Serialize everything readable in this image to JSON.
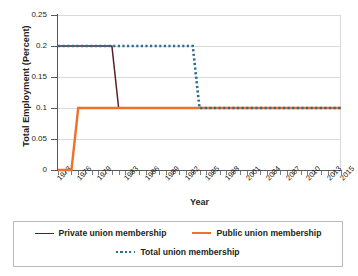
{
  "chart_data": {
    "type": "line",
    "title": "",
    "xlabel": "Year",
    "ylabel": "Total Employment (Percent)",
    "ylim": [
      0,
      0.25
    ],
    "xlim": [
      1973,
      2015
    ],
    "grid": true,
    "legend_position": "bottom",
    "ytick_labels": [
      "0.25",
      "0.2",
      "0.15",
      "0.1",
      "0.05",
      "0"
    ],
    "ytick_values": [
      0.25,
      0.2,
      0.15,
      0.1,
      0.05,
      0
    ],
    "xtick_labels": [
      "1973",
      "1976",
      "1979",
      "1983",
      "1986",
      "1989",
      "1992",
      "1995",
      "1998",
      "2001",
      "2004",
      "2007",
      "2010",
      "2013",
      "2015"
    ],
    "xtick_values": [
      1973,
      1976,
      1979,
      1983,
      1986,
      1989,
      1992,
      1995,
      1998,
      2001,
      2004,
      2007,
      2010,
      2013,
      2015
    ],
    "series": [
      {
        "name": "Private union membership",
        "color": "#5b1f28",
        "style": "solid",
        "x": [
          1973,
          1974,
          1975,
          1976,
          1977,
          1978,
          1979,
          1980,
          1981,
          1982,
          1983,
          1984,
          1985,
          1986,
          1987,
          1988,
          1989,
          1990,
          1991,
          1992,
          1993,
          1994,
          1995,
          1996,
          1997,
          1998,
          1999,
          2000,
          2001,
          2002,
          2003,
          2004,
          2005,
          2006,
          2007,
          2008,
          2009,
          2010,
          2011,
          2012,
          2013,
          2014,
          2015
        ],
        "values": [
          0.2,
          0.2,
          0.2,
          0.2,
          0.2,
          0.2,
          0.2,
          0.2,
          0.2,
          0.1,
          0.1,
          0.1,
          0.1,
          0.1,
          0.1,
          0.1,
          0.1,
          0.1,
          0.1,
          0.1,
          0.1,
          0.1,
          0.1,
          0.1,
          0.1,
          0.1,
          0.1,
          0.1,
          0.1,
          0.1,
          0.1,
          0.1,
          0.1,
          0.1,
          0.1,
          0.1,
          0.1,
          0.1,
          0.1,
          0.1,
          0.1,
          0.1,
          0.1
        ]
      },
      {
        "name": "Public union membership",
        "color": "#ed7129",
        "style": "solid",
        "x": [
          1973,
          1974,
          1975,
          1976,
          1977,
          1978,
          1979,
          1980,
          1981,
          1982,
          1983,
          1984,
          1985,
          1986,
          1987,
          1988,
          1989,
          1990,
          1991,
          1992,
          1993,
          1994,
          1995,
          1996,
          1997,
          1998,
          1999,
          2000,
          2001,
          2002,
          2003,
          2004,
          2005,
          2006,
          2007,
          2008,
          2009,
          2010,
          2011,
          2012,
          2013,
          2014,
          2015
        ],
        "values": [
          0,
          0,
          0,
          0.1,
          0.1,
          0.1,
          0.1,
          0.1,
          0.1,
          0.1,
          0.1,
          0.1,
          0.1,
          0.1,
          0.1,
          0.1,
          0.1,
          0.1,
          0.1,
          0.1,
          0.1,
          0.1,
          0.1,
          0.1,
          0.1,
          0.1,
          0.1,
          0.1,
          0.1,
          0.1,
          0.1,
          0.1,
          0.1,
          0.1,
          0.1,
          0.1,
          0.1,
          0.1,
          0.1,
          0.1,
          0.1,
          0.1,
          0.1
        ]
      },
      {
        "name": "Total union membership",
        "color": "#2c6e8f",
        "style": "dotted",
        "x": [
          1973,
          1974,
          1975,
          1976,
          1977,
          1978,
          1979,
          1980,
          1981,
          1982,
          1983,
          1984,
          1985,
          1986,
          1987,
          1988,
          1989,
          1990,
          1991,
          1992,
          1993,
          1994,
          1995,
          1996,
          1997,
          1998,
          1999,
          2000,
          2001,
          2002,
          2003,
          2004,
          2005,
          2006,
          2007,
          2008,
          2009,
          2010,
          2011,
          2012,
          2013,
          2014,
          2015
        ],
        "values": [
          0.2,
          0.2,
          0.2,
          0.2,
          0.2,
          0.2,
          0.2,
          0.2,
          0.2,
          0.2,
          0.2,
          0.2,
          0.2,
          0.2,
          0.2,
          0.2,
          0.2,
          0.2,
          0.2,
          0.2,
          0.2,
          0.1,
          0.1,
          0.1,
          0.1,
          0.1,
          0.1,
          0.1,
          0.1,
          0.1,
          0.1,
          0.1,
          0.1,
          0.1,
          0.1,
          0.1,
          0.1,
          0.1,
          0.1,
          0.1,
          0.1,
          0.1,
          0.1
        ]
      }
    ]
  },
  "legend": {
    "items": [
      {
        "label": "Private union membership"
      },
      {
        "label": "Public union membership"
      },
      {
        "label": "Total union membership"
      }
    ]
  }
}
